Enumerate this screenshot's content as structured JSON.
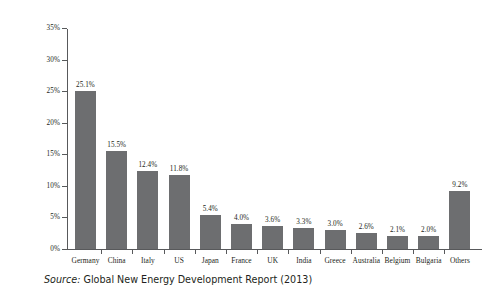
{
  "chart_data": {
    "type": "bar",
    "title": "",
    "subtitle": "",
    "xlabel": "",
    "ylabel": "",
    "ylim": [
      0,
      35
    ],
    "y_tick_labels": [
      "0%",
      "5%",
      "10%",
      "15%",
      "20%",
      "25%",
      "30%",
      "35%"
    ],
    "y_ticks": [
      0,
      5,
      10,
      15,
      20,
      25,
      30,
      35
    ],
    "grid": false,
    "legend": false,
    "bar_color": "#6d6e70",
    "axis_color": "#58595b",
    "categories": [
      "Germany",
      "China",
      "Italy",
      "US",
      "Japan",
      "France",
      "UK",
      "India",
      "Greece",
      "Australia",
      "Belgium",
      "Bulgaria",
      "Others"
    ],
    "values": [
      25.1,
      15.5,
      12.4,
      11.8,
      5.4,
      4.0,
      3.6,
      3.3,
      3.0,
      2.6,
      2.1,
      2.0,
      9.2
    ],
    "value_labels": [
      "25.1%",
      "15.5%",
      "12.4%",
      "11.8%",
      "5.4%",
      "4.0%",
      "3.6%",
      "3.3%",
      "3.0%",
      "2.6%",
      "2.1%",
      "2.0%",
      "9.2%"
    ]
  },
  "source": {
    "prefix": "Source:",
    "text": "Global New Energy Development Report (2013)"
  }
}
